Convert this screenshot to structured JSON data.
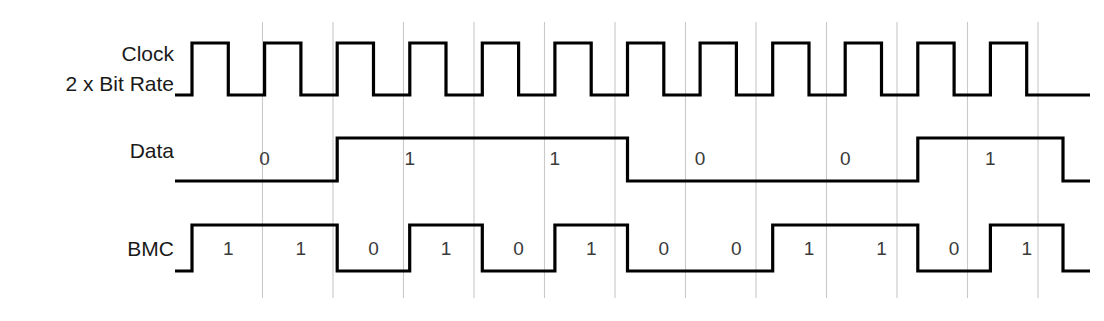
{
  "figure": {
    "kind": "timing-diagram",
    "width": 1104,
    "height": 321,
    "background_color": "#ffffff",
    "wave_color": "#000000",
    "gridline_color": "#c9c9c9",
    "label_color": "#1a1a1a",
    "bit_label_color": "#3a3a3a"
  },
  "geometry": {
    "wave_start_x": 192,
    "wave_end_x": 1063,
    "lead_in_x": 175,
    "lead_out_x": 1090,
    "clock_period_px": 70.5,
    "clock_half_periods": 24,
    "gridline_top_y": 22,
    "gridline_bottom_y": 298,
    "label_right_x": 174
  },
  "rows": [
    {
      "id": "clock",
      "name": "clock-row",
      "label_lines": [
        "Clock",
        "2 x Bit Rate"
      ],
      "label_y": [
        55,
        85
      ],
      "high_y": 43,
      "low_y": 95,
      "bit_label_y": null,
      "bit_labels": []
    },
    {
      "id": "data",
      "name": "data-row",
      "label_lines": [
        "Data"
      ],
      "label_y": [
        152
      ],
      "high_y": 138,
      "low_y": 181,
      "bit_label_y": 160,
      "bit_labels": [
        "0",
        "1",
        "1",
        "0",
        "0",
        "1"
      ]
    },
    {
      "id": "bmc",
      "name": "bmc-row",
      "label_lines": [
        "BMC"
      ],
      "label_y": [
        250
      ],
      "high_y": 225,
      "low_y": 271,
      "bit_label_y": 250,
      "bit_labels": [
        "1",
        "1",
        "0",
        "1",
        "0",
        "1",
        "0",
        "0",
        "1",
        "1",
        "0",
        "1"
      ]
    }
  ],
  "signals": {
    "clock": {
      "name": "Clock 2 x Bit Rate",
      "description": "Square wave at twice the data bit rate; rises at each half-bit cell boundary.",
      "initial_level": 0,
      "half_period_count": 24,
      "levels": [
        1,
        0,
        1,
        0,
        1,
        0,
        1,
        0,
        1,
        0,
        1,
        0,
        1,
        0,
        1,
        0,
        1,
        0,
        1,
        0,
        1,
        0,
        1,
        0
      ]
    },
    "data": {
      "name": "Data",
      "description": "NRZ data, one cell per bit, each bit spans two clock periods.",
      "bits": [
        0,
        1,
        1,
        0,
        0,
        1
      ],
      "bit_width_clock_periods": 2
    },
    "bmc": {
      "name": "BMC",
      "description": "Biphase Mark Code: level transition at every bit boundary; additional mid-bit transition for a '1'.",
      "half_cells": [
        1,
        1,
        0,
        1,
        0,
        1,
        0,
        0,
        1,
        1,
        0,
        1
      ],
      "half_cell_width_clock_periods": 1
    }
  },
  "chart_data": {
    "type": "line",
    "xlabel": "",
    "ylabel": "",
    "x": [
      0,
      1,
      2,
      3,
      4,
      5,
      6,
      7,
      8,
      9,
      10,
      11,
      12
    ],
    "series": [
      {
        "name": "Clock 2 x Bit Rate",
        "values": [
          1,
          0,
          1,
          0,
          1,
          0,
          1,
          0,
          1,
          0,
          1,
          0,
          1
        ]
      },
      {
        "name": "Data",
        "values": [
          0,
          0,
          1,
          1,
          1,
          1,
          0,
          0,
          0,
          0,
          1,
          1,
          1
        ]
      },
      {
        "name": "BMC",
        "values": [
          1,
          1,
          0,
          1,
          0,
          1,
          0,
          0,
          1,
          1,
          0,
          1,
          0
        ]
      }
    ],
    "legend_position": "left-labels",
    "grid": true
  }
}
